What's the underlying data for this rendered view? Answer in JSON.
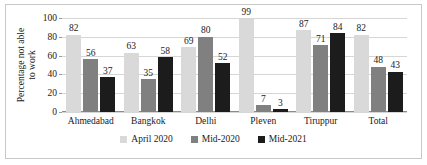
{
  "chart_data": {
    "type": "bar",
    "title": "",
    "subtitle": "",
    "xlabel": "",
    "ylabel_lines": [
      "Percentage not able",
      "to work"
    ],
    "ylabel": "Percentage not able to work",
    "categories": [
      "Ahmedabad",
      "Bangkok",
      "Delhi",
      "Pleven",
      "Tiruppur",
      "Total"
    ],
    "series": [
      {
        "name": "April 2020",
        "color": "#d9d9d9",
        "values": [
          82,
          63,
          69,
          99,
          87,
          82
        ]
      },
      {
        "name": "Mid-2020",
        "color": "#808080",
        "values": [
          56,
          35,
          80,
          7,
          71,
          48
        ]
      },
      {
        "name": "Mid-2021",
        "color": "#1c1c1c",
        "values": [
          37,
          58,
          52,
          3,
          84,
          43
        ]
      }
    ],
    "ylim": [
      0,
      100
    ],
    "yticks": [
      100,
      80,
      60,
      40,
      20,
      0
    ],
    "ytick_labels": [
      "100",
      "80",
      "60",
      "40",
      "20",
      "0"
    ],
    "grid": true,
    "data_labels": true,
    "legend_position": "bottom",
    "legend": [
      "April 2020",
      "Mid-2020",
      "Mid-2021"
    ]
  },
  "colors": {
    "series_1": "#d9d9d9",
    "series_2": "#808080",
    "series_3": "#1c1c1c",
    "gridline": "#d6d6d6",
    "axis": "#8c8c8c",
    "text": "#1a1a1a",
    "frame": "#c8c8c8",
    "background": "#ffffff"
  }
}
